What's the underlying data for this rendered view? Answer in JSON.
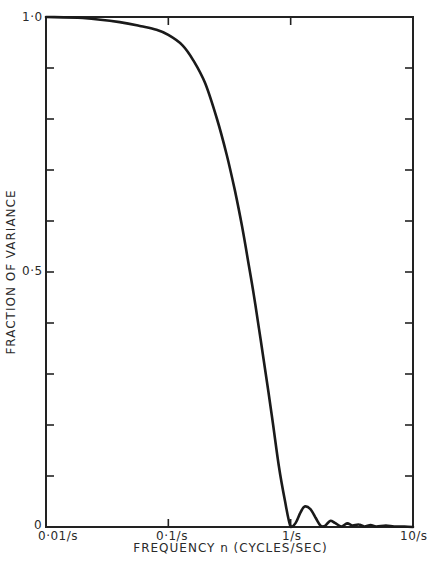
{
  "chart_data": {
    "type": "line",
    "title": "",
    "xlabel": "FREQUENCY n (CYCLES/SEC)",
    "ylabel": "FRACTION OF VARIANCE",
    "xscale": "log",
    "xlim": [
      0.01,
      10
    ],
    "ylim": [
      0,
      1.0
    ],
    "x_tick_labels": [
      "0·01/s",
      "0·1/s",
      "1/s",
      "10/s"
    ],
    "y_tick_labels": [
      "0",
      "0·5",
      "1·0"
    ],
    "y_minor_tick_step": 0.1,
    "grid": false,
    "legend": null,
    "series": [
      {
        "name": "fraction of variance",
        "x": [
          0.01,
          0.02,
          0.04,
          0.06,
          0.08,
          0.1,
          0.13,
          0.16,
          0.2,
          0.25,
          0.3,
          0.35,
          0.4,
          0.45,
          0.5,
          0.55,
          0.6,
          0.7,
          0.8,
          0.9,
          1.0,
          1.1,
          1.2,
          1.3,
          1.45,
          1.6,
          1.75,
          1.9,
          2.1,
          2.3,
          2.6,
          2.9,
          3.2,
          3.6,
          4.0,
          4.5,
          5.0,
          6.0,
          7.0,
          8.5,
          10.0
        ],
        "y": [
          1.0,
          0.998,
          0.99,
          0.982,
          0.975,
          0.965,
          0.945,
          0.915,
          0.87,
          0.8,
          0.73,
          0.66,
          0.59,
          0.52,
          0.455,
          0.39,
          0.33,
          0.22,
          0.12,
          0.05,
          0.0,
          0.008,
          0.028,
          0.04,
          0.035,
          0.018,
          0.003,
          0.002,
          0.012,
          0.008,
          0.001,
          0.007,
          0.003,
          0.005,
          0.001,
          0.004,
          0.001,
          0.003,
          0.001,
          0.001,
          0.0
        ]
      }
    ]
  },
  "axes": {
    "y_top_label": "1·0",
    "y_mid_label": "0·5",
    "y_bottom_label": "0",
    "x_labels": [
      "0·01/s",
      "0·1/s",
      "1/s",
      "10/s"
    ],
    "xlabel": "FREQUENCY n (CYCLES/SEC)",
    "ylabel": "FRACTION OF VARIANCE"
  },
  "colors": {
    "line": "#1a1a1a",
    "axis": "#222222",
    "background": "#ffffff"
  }
}
